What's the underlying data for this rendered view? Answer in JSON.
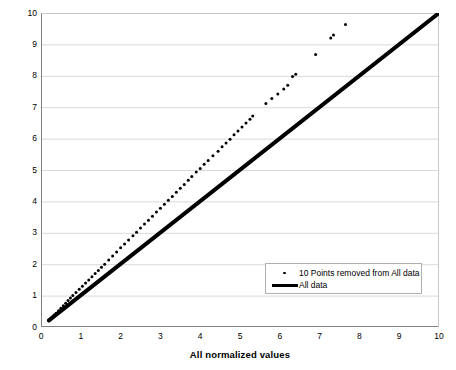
{
  "chart_data": {
    "type": "scatter",
    "title": "",
    "xlabel": "All normalized values",
    "ylabel": "10 Points removed from Normalized Values",
    "xlim": [
      0,
      10
    ],
    "ylim": [
      0,
      10
    ],
    "xticks": [
      "0",
      "1",
      "2",
      "3",
      "4",
      "5",
      "6",
      "7",
      "8",
      "9",
      "10"
    ],
    "yticks": [
      "0",
      "1",
      "2",
      "3",
      "4",
      "5",
      "6",
      "7",
      "8",
      "9",
      "10"
    ],
    "grid": "horizontal",
    "legend_position": "inside-bottom-right",
    "background_color": "#ffffff",
    "gridline_color": "#d9d9d9",
    "axis_color": "#808080",
    "series": [
      {
        "name": "10 Points removed from All data",
        "type": "scatter",
        "marker": "dot",
        "color": "#000000",
        "points": [
          [
            0.2,
            0.21
          ],
          [
            0.24,
            0.26
          ],
          [
            0.28,
            0.32
          ],
          [
            0.33,
            0.38
          ],
          [
            0.38,
            0.44
          ],
          [
            0.44,
            0.52
          ],
          [
            0.5,
            0.6
          ],
          [
            0.56,
            0.68
          ],
          [
            0.62,
            0.76
          ],
          [
            0.68,
            0.84
          ],
          [
            0.74,
            0.92
          ],
          [
            0.8,
            1.0
          ],
          [
            0.88,
            1.1
          ],
          [
            0.96,
            1.2
          ],
          [
            1.04,
            1.3
          ],
          [
            1.12,
            1.4
          ],
          [
            1.2,
            1.5
          ],
          [
            1.28,
            1.6
          ],
          [
            1.36,
            1.7
          ],
          [
            1.44,
            1.8
          ],
          [
            1.52,
            1.9
          ],
          [
            1.6,
            2.0
          ],
          [
            1.7,
            2.13
          ],
          [
            1.8,
            2.26
          ],
          [
            1.9,
            2.39
          ],
          [
            2.0,
            2.52
          ],
          [
            2.1,
            2.64
          ],
          [
            2.2,
            2.77
          ],
          [
            2.31,
            2.91
          ],
          [
            2.4,
            3.02
          ],
          [
            2.5,
            3.15
          ],
          [
            2.6,
            3.28
          ],
          [
            2.7,
            3.4
          ],
          [
            2.8,
            3.53
          ],
          [
            2.9,
            3.66
          ],
          [
            3.0,
            3.78
          ],
          [
            3.1,
            3.91
          ],
          [
            3.2,
            4.04
          ],
          [
            3.3,
            4.16
          ],
          [
            3.4,
            4.29
          ],
          [
            3.5,
            4.42
          ],
          [
            3.6,
            4.54
          ],
          [
            3.7,
            4.67
          ],
          [
            3.79,
            4.79
          ],
          [
            3.9,
            4.94
          ],
          [
            4.0,
            5.05
          ],
          [
            4.1,
            5.18
          ],
          [
            4.2,
            5.3
          ],
          [
            4.32,
            5.45
          ],
          [
            4.45,
            5.6
          ],
          [
            4.55,
            5.74
          ],
          [
            4.65,
            5.86
          ],
          [
            4.75,
            5.98
          ],
          [
            4.85,
            6.12
          ],
          [
            4.95,
            6.24
          ],
          [
            5.05,
            6.37
          ],
          [
            5.15,
            6.5
          ],
          [
            5.25,
            6.62
          ],
          [
            5.32,
            6.72
          ],
          [
            5.65,
            7.12
          ],
          [
            5.8,
            7.28
          ],
          [
            5.95,
            7.42
          ],
          [
            6.1,
            7.58
          ],
          [
            6.2,
            7.7
          ],
          [
            6.32,
            7.98
          ],
          [
            6.4,
            8.05
          ],
          [
            6.9,
            8.68
          ],
          [
            7.28,
            9.2
          ],
          [
            7.35,
            9.3
          ],
          [
            7.65,
            9.63
          ]
        ]
      },
      {
        "name": "All data",
        "type": "line",
        "color": "#000000",
        "linewidth": 4,
        "points": [
          [
            0.2,
            0.21
          ],
          [
            10.0,
            10.0
          ]
        ]
      }
    ]
  },
  "legend": {
    "entries": [
      {
        "label": "10 Points removed from All data",
        "key": "dot"
      },
      {
        "label": "All data",
        "key": "line"
      }
    ]
  }
}
